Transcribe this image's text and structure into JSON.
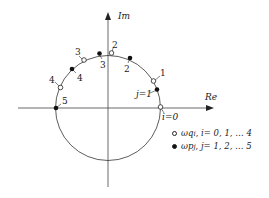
{
  "axes": {
    "x_label": "Re",
    "y_label": "Im"
  },
  "open_points": {
    "labels": [
      "i=0",
      "1",
      "2",
      "3",
      "4"
    ]
  },
  "filled_points": {
    "labels": [
      "j=1",
      "2",
      "3",
      "4",
      "5"
    ]
  },
  "legend": [
    {
      "marker": "open-circle",
      "symbol": "ωq",
      "subscript": "i",
      "text": "i= 0, 1, … 4"
    },
    {
      "marker": "filled-circle",
      "symbol": "ωp",
      "subscript": "j",
      "text": "j= 1, 2, … 5"
    }
  ],
  "colors": {
    "line": "#333333",
    "open_fill": "#ffffff",
    "filled_fill": "#111111"
  }
}
